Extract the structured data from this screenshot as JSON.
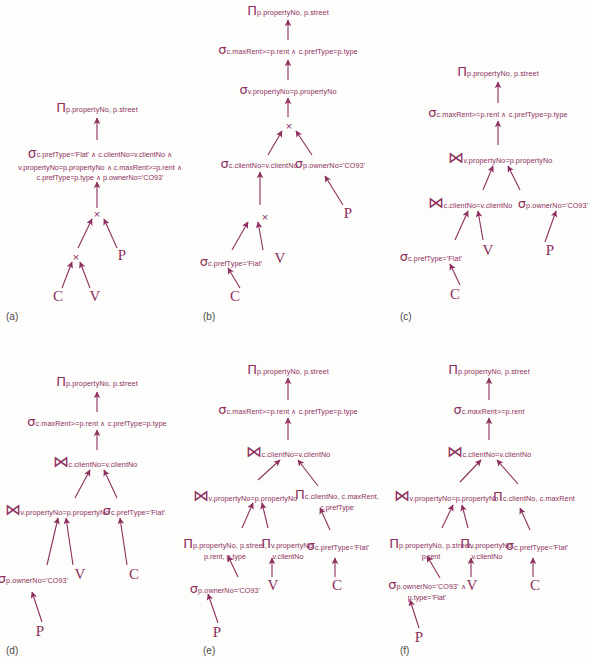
{
  "figure": {
    "ink_color": "#8d2f5e",
    "label_color": "#4a4a4a"
  },
  "symbols": {
    "project": "Π",
    "select": "σ",
    "cartesian": "×",
    "join": "⋈",
    "and": "∧"
  },
  "panels": [
    {
      "id": "a",
      "label": "(a)",
      "nodes": [
        {
          "name": "project-root",
          "op": "Π",
          "sub": [
            "p.propertyNo, p.street"
          ]
        },
        {
          "name": "select-predicate",
          "op": "σ",
          "sub": [
            "c.prefType='Flat' ∧ c.clientNo=v.clientNo ∧",
            "v.propertyNo=p.propertyNo ∧ c.maxRent>=p.rent ∧",
            "c.prefType=p.type ∧ p.ownerNo='CO93'"
          ]
        },
        {
          "name": "cartesian-upper",
          "op": "×",
          "sub": []
        },
        {
          "name": "cartesian-lower",
          "op": "×",
          "sub": []
        },
        {
          "name": "relation-P",
          "op": "P",
          "sub": []
        },
        {
          "name": "relation-C",
          "op": "C",
          "sub": []
        },
        {
          "name": "relation-V",
          "op": "V",
          "sub": []
        }
      ]
    },
    {
      "id": "b",
      "label": "(b)",
      "nodes": [
        {
          "name": "project-root",
          "op": "Π",
          "sub": [
            "p.propertyNo, p.street"
          ]
        },
        {
          "name": "select-maxrent",
          "op": "σ",
          "sub": [
            "c.maxRent>=p.rent ∧ c.prefType=p.type"
          ]
        },
        {
          "name": "select-propertyno",
          "op": "σ",
          "sub": [
            "v.propertyNo=p.propertyNo"
          ]
        },
        {
          "name": "cartesian-upper",
          "op": "×",
          "sub": []
        },
        {
          "name": "select-clientno",
          "op": "σ",
          "sub": [
            "c.clientNo=v.clientNo"
          ]
        },
        {
          "name": "select-ownerno",
          "op": "σ",
          "sub": [
            "p.ownerNo='CO93'"
          ]
        },
        {
          "name": "relation-P",
          "op": "P",
          "sub": []
        },
        {
          "name": "cartesian-lower",
          "op": "×",
          "sub": []
        },
        {
          "name": "select-preftype",
          "op": "σ",
          "sub": [
            "c.prefType='Flat'"
          ]
        },
        {
          "name": "relation-V",
          "op": "V",
          "sub": []
        },
        {
          "name": "relation-C",
          "op": "C",
          "sub": []
        }
      ]
    },
    {
      "id": "c",
      "label": "(c)",
      "nodes": [
        {
          "name": "project-root",
          "op": "Π",
          "sub": [
            "p.propertyNo, p.street"
          ]
        },
        {
          "name": "select-maxrent",
          "op": "σ",
          "sub": [
            "c.maxRent>=p.rent ∧ c.prefType=p.type"
          ]
        },
        {
          "name": "join-propertyno",
          "op": "⋈",
          "sub": [
            "v.propertyNo=p.propertyNo"
          ]
        },
        {
          "name": "join-clientno",
          "op": "⋈",
          "sub": [
            "c.clientNo=v.clientNo"
          ]
        },
        {
          "name": "select-ownerno",
          "op": "σ",
          "sub": [
            "p.ownerNo='CO93'"
          ]
        },
        {
          "name": "select-preftype",
          "op": "σ",
          "sub": [
            "c.prefType='Flat'"
          ]
        },
        {
          "name": "relation-V",
          "op": "V",
          "sub": []
        },
        {
          "name": "relation-P",
          "op": "P",
          "sub": []
        },
        {
          "name": "relation-C",
          "op": "C",
          "sub": []
        }
      ]
    },
    {
      "id": "d",
      "label": "(d)",
      "nodes": [
        {
          "name": "project-root",
          "op": "Π",
          "sub": [
            "p.propertyNo, p.street"
          ]
        },
        {
          "name": "select-maxrent",
          "op": "σ",
          "sub": [
            "c.maxRent>=p.rent ∧ c.prefType=p.type"
          ]
        },
        {
          "name": "join-clientno",
          "op": "⋈",
          "sub": [
            "c.clientNo=v.clientNo"
          ]
        },
        {
          "name": "join-propertyno",
          "op": "⋈",
          "sub": [
            "v.propertyNo=p.propertyNo"
          ]
        },
        {
          "name": "select-preftype",
          "op": "σ",
          "sub": [
            "c.prefType='Flat'"
          ]
        },
        {
          "name": "select-ownerno",
          "op": "σ",
          "sub": [
            "p.ownerNo='CO93'"
          ]
        },
        {
          "name": "relation-V",
          "op": "V",
          "sub": []
        },
        {
          "name": "relation-C",
          "op": "C",
          "sub": []
        },
        {
          "name": "relation-P",
          "op": "P",
          "sub": []
        }
      ]
    },
    {
      "id": "e",
      "label": "(e)",
      "nodes": [
        {
          "name": "project-root",
          "op": "Π",
          "sub": [
            "p.propertyNo, p.street"
          ]
        },
        {
          "name": "select-maxrent",
          "op": "σ",
          "sub": [
            "c.maxRent>=p.rent ∧ c.prefType=p.type"
          ]
        },
        {
          "name": "join-clientno",
          "op": "⋈",
          "sub": [
            "c.clientNo=v.clientNo"
          ]
        },
        {
          "name": "join-propertyno",
          "op": "⋈",
          "sub": [
            "v.propertyNo=p.propertyNo"
          ]
        },
        {
          "name": "project-client",
          "op": "Π",
          "sub": [
            "c.clientNo, c.maxRent,",
            "c.prefType"
          ]
        },
        {
          "name": "project-property",
          "op": "Π",
          "sub": [
            "p.propertyNo, p.street,",
            "p.rent, p.type"
          ]
        },
        {
          "name": "project-viewing",
          "op": "Π",
          "sub": [
            "v.propertyNo,",
            "v.clientNo"
          ]
        },
        {
          "name": "select-preftype",
          "op": "σ",
          "sub": [
            "c.prefType='Flat'"
          ]
        },
        {
          "name": "select-ownerno",
          "op": "σ",
          "sub": [
            "p.ownerNo='CO93'"
          ]
        },
        {
          "name": "relation-V",
          "op": "V",
          "sub": []
        },
        {
          "name": "relation-C",
          "op": "C",
          "sub": []
        },
        {
          "name": "relation-P",
          "op": "P",
          "sub": []
        }
      ]
    },
    {
      "id": "f",
      "label": "(f)",
      "nodes": [
        {
          "name": "project-root",
          "op": "Π",
          "sub": [
            "p.propertyNo, p.street"
          ]
        },
        {
          "name": "select-maxrent",
          "op": "σ",
          "sub": [
            "c.maxRent>=p.rent"
          ]
        },
        {
          "name": "join-clientno",
          "op": "⋈",
          "sub": [
            "c.clientNo=v.clientNo"
          ]
        },
        {
          "name": "join-propertyno",
          "op": "⋈",
          "sub": [
            "v.propertyNo=p.propertyNo"
          ]
        },
        {
          "name": "project-client",
          "op": "Π",
          "sub": [
            "c.clientNo, c.maxRent"
          ]
        },
        {
          "name": "project-property",
          "op": "Π",
          "sub": [
            "p.propertyNo, p.street,",
            "p.rent"
          ]
        },
        {
          "name": "project-viewing",
          "op": "Π",
          "sub": [
            "v.propertyNo,",
            "v.clientNo"
          ]
        },
        {
          "name": "select-preftype",
          "op": "σ",
          "sub": [
            "c.prefType='Flat'"
          ]
        },
        {
          "name": "select-ownerno",
          "op": "σ",
          "sub": [
            "p.ownerNo='CO93' ∧",
            "p.type='Flat'"
          ]
        },
        {
          "name": "relation-V",
          "op": "V",
          "sub": []
        },
        {
          "name": "relation-C",
          "op": "C",
          "sub": []
        },
        {
          "name": "relation-P",
          "op": "P",
          "sub": []
        }
      ]
    }
  ]
}
